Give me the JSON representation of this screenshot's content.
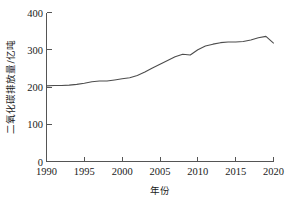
{
  "chart_data": {
    "type": "line",
    "title": "",
    "xlabel": "年份",
    "ylabel": "二氧化碳排放量/亿吨",
    "xlim": [
      1990,
      2020
    ],
    "ylim": [
      0,
      400
    ],
    "xticks": [
      1990,
      1995,
      2000,
      2005,
      2010,
      2015,
      2020
    ],
    "xtick_labels": [
      "1990",
      "1995",
      "2000",
      "2005",
      "2010",
      "2015",
      "2020"
    ],
    "yticks": [
      0,
      100,
      200,
      300,
      400
    ],
    "ytick_labels": [
      "0",
      "100",
      "200",
      "300",
      "400"
    ],
    "grid": false,
    "legend": false,
    "line_color": "#4d4d4d",
    "axis_color": "#555555",
    "x": [
      1990,
      1991,
      1992,
      1993,
      1994,
      1995,
      1996,
      1997,
      1998,
      1999,
      2000,
      2001,
      2002,
      2003,
      2004,
      2005,
      2006,
      2007,
      2008,
      2009,
      2010,
      2011,
      2012,
      2013,
      2014,
      2015,
      2016,
      2017,
      2018,
      2019,
      2020
    ],
    "values": [
      203,
      204,
      204,
      205,
      207,
      210,
      214,
      216,
      216,
      219,
      222,
      225,
      231,
      240,
      251,
      261,
      271,
      281,
      288,
      286,
      300,
      310,
      315,
      319,
      321,
      321,
      322,
      326,
      332,
      336,
      318
    ],
    "series": [
      {
        "name": "二氧化碳排放量",
        "values": [
          203,
          204,
          204,
          205,
          207,
          210,
          214,
          216,
          216,
          219,
          222,
          225,
          231,
          240,
          251,
          261,
          271,
          281,
          288,
          286,
          300,
          310,
          315,
          319,
          321,
          321,
          322,
          326,
          332,
          336,
          318
        ]
      }
    ],
    "annotations": []
  },
  "axes": {
    "y_title": "二氧化碳排放量/亿吨",
    "x_title": "年份"
  }
}
